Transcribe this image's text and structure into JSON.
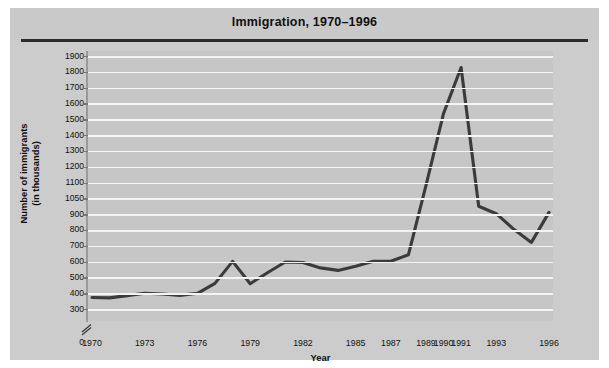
{
  "chart": {
    "title": "Immigration, 1970–1996",
    "ylabel_line1": "Number of immigrants",
    "ylabel_line2": "(in thousands)",
    "xlabel": "Year",
    "zero_label": "0",
    "line_color": "#3b3b3b",
    "plot_bg": "#c6c6c6",
    "panel_bg": "#cccccc",
    "grid_color": "#f4f4f4"
  },
  "chart_data": {
    "type": "line",
    "title": "Immigration, 1970–1996",
    "xlabel": "Year",
    "ylabel": "Number of immigrants (in thousands)",
    "x": [
      1970,
      1971,
      1972,
      1973,
      1974,
      1975,
      1976,
      1977,
      1978,
      1979,
      1980,
      1981,
      1982,
      1983,
      1984,
      1985,
      1986,
      1987,
      1988,
      1989,
      1990,
      1991,
      1992,
      1993,
      1994,
      1995,
      1996
    ],
    "values": [
      373,
      370,
      385,
      400,
      395,
      386,
      399,
      462,
      601,
      460,
      531,
      597,
      594,
      560,
      544,
      570,
      602,
      602,
      643,
      1091,
      1536,
      1827,
      974,
      904,
      804,
      721,
      916
    ],
    "xtick_labels": [
      "1970",
      "1973",
      "1976",
      "1979",
      "1982",
      "1985",
      "1987",
      "1989",
      "1990",
      "1991",
      "1993",
      "1996"
    ],
    "ytick_labels": [
      "1900",
      "1800",
      "1700",
      "1600",
      "1500",
      "1400",
      "1300",
      "1200",
      "1100",
      "1050",
      "900",
      "800",
      "700",
      "600",
      "500",
      "400",
      "300"
    ],
    "ytick_values": [
      1900,
      1800,
      1700,
      1600,
      1500,
      1400,
      1300,
      1200,
      1100,
      1050,
      900,
      800,
      700,
      600,
      500,
      400,
      300
    ],
    "ylim": [
      300,
      1900
    ],
    "xlim": [
      1970,
      1996
    ],
    "axis_break": true,
    "axis_origin_label": "0",
    "grid": true,
    "legend": "none"
  }
}
